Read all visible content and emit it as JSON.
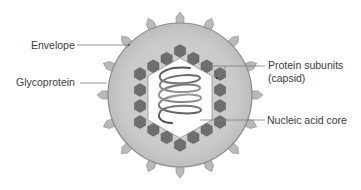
{
  "diagram": {
    "labels": {
      "envelope": "Envelope",
      "glycoprotein": "Glycoprotein",
      "protein_subunits_line1": "Protein subunits",
      "protein_subunits_line2": "(capsid)",
      "nucleic_acid_core": "Nucleic acid core"
    },
    "colors": {
      "envelope_fill": "#c8c8c8",
      "envelope_outline": "#8a8a8a",
      "spike_fill": "#b9b9b9",
      "spike_outline": "#8c8c8c",
      "capsomere_fill": "#6e6e6e",
      "capsid_interior": "#ffffff",
      "helix_stroke": "#4a4a4a",
      "leader_line": "#7a7a7a",
      "text": "#3a3a3a"
    }
  }
}
